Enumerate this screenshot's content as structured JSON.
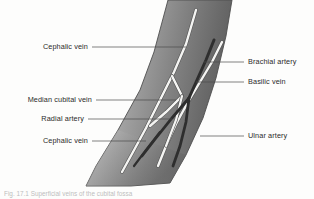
{
  "figure": {
    "kind": "anatomical-illustration",
    "caption": "Fig. 17.1 Superficial veins of the cubital fossa",
    "background_color": "#fdfdfc",
    "leader_line_color": "#4a4a4a",
    "label_color": "#2b2b2b",
    "arm": {
      "skin_light": "#d8d8d8",
      "skin_mid": "#a8a8a8",
      "skin_dark": "#6e6e6e",
      "outline_color": "#5a5a5a"
    },
    "vessels": {
      "vein_color": "#f4f4f2",
      "vein_outline": "#555555",
      "artery_color": "#2e2e2e"
    }
  },
  "labels": {
    "left": [
      {
        "id": "cephalic-vein-upper",
        "text": "Cephalic vein"
      },
      {
        "id": "median-cubital-vein",
        "text": "Median cubital vein"
      },
      {
        "id": "radial-artery",
        "text": "Radial artery"
      },
      {
        "id": "cephalic-vein-lower",
        "text": "Cephalic vein"
      }
    ],
    "right": [
      {
        "id": "brachial-artery",
        "text": "Brachial artery"
      },
      {
        "id": "basilic-vein",
        "text": "Basilic vein"
      },
      {
        "id": "ulnar-artery",
        "text": "Ulnar artery"
      }
    ]
  }
}
